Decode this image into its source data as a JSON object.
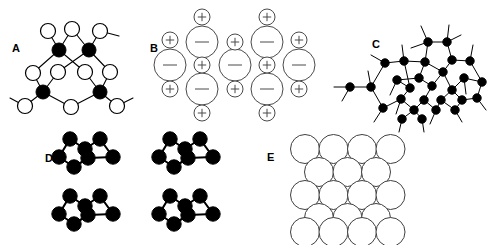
{
  "figure": {
    "width": 489,
    "height": 247,
    "background": "#ffffff",
    "colors": {
      "line": "#000000",
      "open_atom_fill": "#ffffff",
      "filled_atom_fill": "#000000",
      "ion_stroke": "#4a4a4a",
      "sphere_stroke": "#3f3f3f"
    }
  },
  "panels": [
    {
      "id": "A",
      "label": "A",
      "label_x": 12,
      "label_y": 52,
      "type": "covalent-network",
      "description": "Two-dimensional covalent network of alternating filled and open atoms joined by bonds",
      "open_atoms": [
        {
          "x": 48,
          "y": 31,
          "r": 7.5
        },
        {
          "x": 72,
          "y": 29,
          "r": 7.5
        },
        {
          "x": 100,
          "y": 31,
          "r": 7.5
        },
        {
          "x": 33,
          "y": 73,
          "r": 7.5
        },
        {
          "x": 58,
          "y": 72,
          "r": 7.5
        },
        {
          "x": 85,
          "y": 72,
          "r": 7.5
        },
        {
          "x": 110,
          "y": 72,
          "r": 7.5
        },
        {
          "x": 25,
          "y": 106,
          "r": 7.5
        },
        {
          "x": 71,
          "y": 107,
          "r": 7.5
        },
        {
          "x": 117,
          "y": 106,
          "r": 7.5
        }
      ],
      "filled_atoms": [
        {
          "x": 59,
          "y": 50,
          "r": 7.0
        },
        {
          "x": 89,
          "y": 50,
          "r": 7.0
        },
        {
          "x": 43,
          "y": 92,
          "r": 7.0
        },
        {
          "x": 100,
          "y": 92,
          "r": 7.0
        }
      ],
      "bonds": [
        [
          48,
          31,
          59,
          50
        ],
        [
          72,
          29,
          59,
          50
        ],
        [
          72,
          29,
          89,
          50
        ],
        [
          100,
          31,
          89,
          50
        ],
        [
          100,
          31,
          119,
          36
        ],
        [
          59,
          50,
          85,
          72
        ],
        [
          89,
          50,
          58,
          72
        ],
        [
          59,
          50,
          33,
          73
        ],
        [
          89,
          50,
          110,
          72
        ],
        [
          33,
          73,
          43,
          92
        ],
        [
          58,
          72,
          43,
          92
        ],
        [
          85,
          72,
          100,
          92
        ],
        [
          110,
          72,
          100,
          92
        ],
        [
          43,
          92,
          25,
          106
        ],
        [
          43,
          92,
          71,
          107
        ],
        [
          100,
          92,
          71,
          107
        ],
        [
          100,
          92,
          117,
          106
        ],
        [
          25,
          106,
          10,
          98
        ],
        [
          117,
          106,
          133,
          98
        ]
      ]
    },
    {
      "id": "B",
      "label": "B",
      "label_x": 150,
      "label_y": 52,
      "type": "ionic-lattice",
      "description": "Ionic lattice of large negative anions and small positive cations",
      "anion_radius": 16,
      "cation_radius": 8,
      "anions": [
        {
          "x": 202,
          "y": 42,
          "charge": "minus"
        },
        {
          "x": 267,
          "y": 42,
          "charge": "minus"
        },
        {
          "x": 170,
          "y": 65,
          "charge": "minus"
        },
        {
          "x": 235,
          "y": 65,
          "charge": "minus"
        },
        {
          "x": 299,
          "y": 65,
          "charge": "minus"
        },
        {
          "x": 202,
          "y": 89,
          "charge": "minus"
        },
        {
          "x": 267,
          "y": 89,
          "charge": "minus"
        }
      ],
      "cations": [
        {
          "x": 202,
          "y": 17,
          "charge": "plus"
        },
        {
          "x": 267,
          "y": 17,
          "charge": "plus"
        },
        {
          "x": 170,
          "y": 40,
          "charge": "plus"
        },
        {
          "x": 235,
          "y": 42,
          "charge": "plus"
        },
        {
          "x": 299,
          "y": 40,
          "charge": "plus"
        },
        {
          "x": 202,
          "y": 65,
          "charge": "plus"
        },
        {
          "x": 267,
          "y": 65,
          "charge": "plus"
        },
        {
          "x": 170,
          "y": 89,
          "charge": "plus"
        },
        {
          "x": 235,
          "y": 89,
          "charge": "plus"
        },
        {
          "x": 299,
          "y": 89,
          "charge": "plus"
        },
        {
          "x": 202,
          "y": 113,
          "charge": "plus"
        },
        {
          "x": 267,
          "y": 113,
          "charge": "plus"
        }
      ]
    },
    {
      "id": "C",
      "label": "C",
      "label_x": 372,
      "label_y": 48,
      "type": "amorphous-network",
      "description": "Random amorphous covalent network of filled atoms with dangling bonds",
      "atom_radius": 4.2,
      "atoms": [
        {
          "x": 428,
          "y": 42
        },
        {
          "x": 447,
          "y": 42
        },
        {
          "x": 404,
          "y": 61
        },
        {
          "x": 425,
          "y": 62
        },
        {
          "x": 452,
          "y": 60
        },
        {
          "x": 470,
          "y": 61
        },
        {
          "x": 385,
          "y": 63
        },
        {
          "x": 443,
          "y": 72
        },
        {
          "x": 397,
          "y": 80
        },
        {
          "x": 419,
          "y": 78
        },
        {
          "x": 464,
          "y": 78
        },
        {
          "x": 482,
          "y": 82
        },
        {
          "x": 410,
          "y": 88
        },
        {
          "x": 432,
          "y": 86
        },
        {
          "x": 452,
          "y": 90
        },
        {
          "x": 350,
          "y": 87
        },
        {
          "x": 371,
          "y": 87
        },
        {
          "x": 401,
          "y": 99
        },
        {
          "x": 424,
          "y": 100
        },
        {
          "x": 441,
          "y": 100
        },
        {
          "x": 462,
          "y": 100
        },
        {
          "x": 477,
          "y": 98
        },
        {
          "x": 383,
          "y": 108
        },
        {
          "x": 414,
          "y": 110
        },
        {
          "x": 436,
          "y": 110
        },
        {
          "x": 455,
          "y": 110
        },
        {
          "x": 402,
          "y": 119
        },
        {
          "x": 422,
          "y": 119
        }
      ],
      "bonds": [
        [
          428,
          42,
          447,
          42
        ],
        [
          428,
          42,
          425,
          62
        ],
        [
          447,
          42,
          452,
          60
        ],
        [
          428,
          42,
          421,
          26
        ],
        [
          447,
          42,
          449,
          25
        ],
        [
          428,
          42,
          411,
          48
        ],
        [
          447,
          42,
          461,
          35
        ],
        [
          404,
          61,
          425,
          62
        ],
        [
          404,
          61,
          385,
          63
        ],
        [
          404,
          61,
          402,
          45
        ],
        [
          425,
          62,
          443,
          72
        ],
        [
          452,
          60,
          470,
          61
        ],
        [
          452,
          60,
          443,
          72
        ],
        [
          470,
          61,
          482,
          82
        ],
        [
          470,
          61,
          473,
          45
        ],
        [
          385,
          63,
          371,
          87
        ],
        [
          385,
          63,
          371,
          55
        ],
        [
          425,
          62,
          419,
          78
        ],
        [
          404,
          61,
          410,
          88
        ],
        [
          443,
          72,
          432,
          86
        ],
        [
          443,
          72,
          452,
          90
        ],
        [
          397,
          80,
          410,
          88
        ],
        [
          397,
          80,
          419,
          78
        ],
        [
          397,
          80,
          390,
          95
        ],
        [
          419,
          78,
          432,
          86
        ],
        [
          464,
          78,
          452,
          90
        ],
        [
          464,
          78,
          482,
          82
        ],
        [
          464,
          78,
          466,
          94
        ],
        [
          482,
          82,
          477,
          98
        ],
        [
          410,
          88,
          401,
          99
        ],
        [
          432,
          86,
          424,
          100
        ],
        [
          452,
          90,
          441,
          100
        ],
        [
          452,
          90,
          462,
          100
        ],
        [
          350,
          87,
          371,
          87
        ],
        [
          350,
          87,
          334,
          87
        ],
        [
          350,
          87,
          342,
          101
        ],
        [
          371,
          87,
          383,
          108
        ],
        [
          371,
          87,
          368,
          71
        ],
        [
          401,
          99,
          414,
          110
        ],
        [
          401,
          99,
          383,
          108
        ],
        [
          401,
          99,
          396,
          114
        ],
        [
          424,
          100,
          414,
          110
        ],
        [
          424,
          100,
          436,
          110
        ],
        [
          441,
          100,
          436,
          110
        ],
        [
          441,
          100,
          455,
          110
        ],
        [
          462,
          100,
          455,
          110
        ],
        [
          462,
          100,
          477,
          98
        ],
        [
          477,
          98,
          486,
          110
        ],
        [
          383,
          108,
          374,
          122
        ],
        [
          414,
          110,
          402,
          119
        ],
        [
          414,
          110,
          422,
          119
        ],
        [
          436,
          110,
          430,
          124
        ],
        [
          455,
          110,
          462,
          122
        ],
        [
          402,
          119,
          399,
          132
        ],
        [
          422,
          119,
          424,
          132
        ]
      ],
      "dangling_bonds": [
        [
          428,
          42,
          421,
          26
        ],
        [
          447,
          42,
          449,
          25
        ],
        [
          404,
          61,
          402,
          45
        ],
        [
          470,
          61,
          473,
          45
        ],
        [
          385,
          63,
          371,
          55
        ],
        [
          371,
          87,
          368,
          71
        ],
        [
          464,
          78,
          466,
          94
        ],
        [
          350,
          87,
          334,
          87
        ]
      ]
    },
    {
      "id": "D",
      "label": "D",
      "label_x": 45,
      "label_y": 162,
      "type": "molecular-clusters",
      "description": "Four identical discrete zigzag molecular units held by weak forces",
      "atom_radius": 7.2,
      "cluster_offsets": [
        {
          "x": 0,
          "y": 0
        },
        {
          "x": 100,
          "y": 0
        },
        {
          "x": 0,
          "y": 57
        },
        {
          "x": 100,
          "y": 57
        }
      ],
      "cluster_atoms": [
        {
          "x": 70,
          "y": 139
        },
        {
          "x": 100,
          "y": 139
        },
        {
          "x": 85,
          "y": 149
        },
        {
          "x": 59,
          "y": 157
        },
        {
          "x": 88,
          "y": 158
        },
        {
          "x": 113,
          "y": 157
        },
        {
          "x": 74,
          "y": 167
        }
      ],
      "cluster_bonds": [
        [
          70,
          139,
          85,
          149
        ],
        [
          85,
          149,
          100,
          139
        ],
        [
          70,
          139,
          59,
          157
        ],
        [
          100,
          139,
          113,
          157
        ],
        [
          59,
          157,
          74,
          167
        ],
        [
          74,
          167,
          88,
          158
        ],
        [
          88,
          158,
          113,
          157
        ],
        [
          85,
          149,
          88,
          158
        ]
      ]
    },
    {
      "id": "E",
      "label": "E",
      "label_x": 267,
      "label_y": 161,
      "type": "close-packed-spheres",
      "description": "Close-packed metallic spheres in alternating rows",
      "sphere_radius": 14.5,
      "rows": [
        {
          "y": 149,
          "count": 4,
          "x_start": 305,
          "spacing": 28.5
        },
        {
          "y": 172,
          "count": 3,
          "x_start": 319,
          "spacing": 28.5
        },
        {
          "y": 195,
          "count": 4,
          "x_start": 305,
          "spacing": 28.5
        },
        {
          "y": 218,
          "count": 3,
          "x_start": 319,
          "spacing": 28.5
        },
        {
          "y": 232,
          "count": 4,
          "x_start": 305,
          "spacing": 28.5
        }
      ]
    }
  ]
}
